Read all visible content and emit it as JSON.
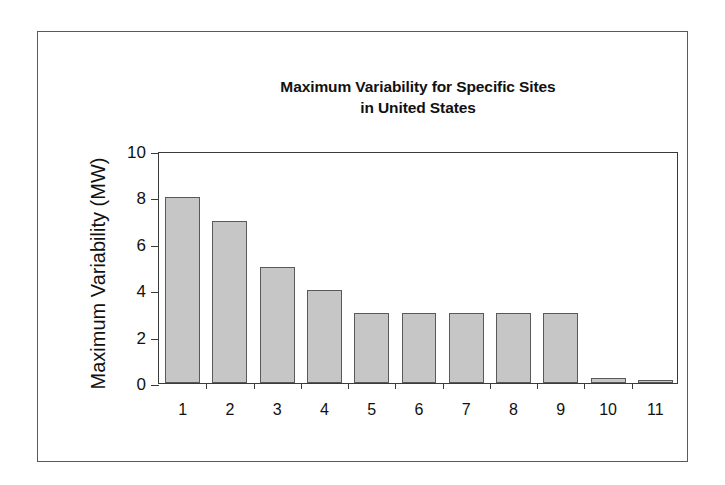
{
  "figure": {
    "frame_border_color": "#5a5a5a",
    "background_color": "#ffffff"
  },
  "chart_data": {
    "type": "bar",
    "title": "Maximum Variability for Specific Sites\nin United States",
    "xlabel": "",
    "ylabel": "Maximum Variability (MW)",
    "categories": [
      "1",
      "2",
      "3",
      "4",
      "5",
      "6",
      "7",
      "8",
      "9",
      "10",
      "11"
    ],
    "values": [
      8,
      7,
      5,
      4,
      3,
      3,
      3,
      3,
      3,
      0.2,
      0.1
    ],
    "ylim": [
      0,
      10
    ],
    "yticks": [
      0,
      2,
      4,
      6,
      8,
      10
    ],
    "ytick_labels": [
      "0",
      "2",
      "4",
      "6",
      "8",
      "10"
    ],
    "grid": false,
    "legend": null,
    "bar_fill_color": "#c6c6c6",
    "bar_border_color": "#595959",
    "axis_color": "#3a3a3a"
  }
}
